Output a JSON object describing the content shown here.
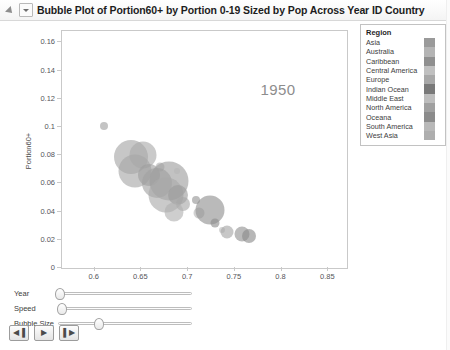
{
  "titlebar": {
    "title": "Bubble Plot of Portion60+ by Portion 0-19 Sized by Pop Across Year ID Country",
    "disclosure_icon": "disclosure-triangle-icon",
    "menu_icon": "chevron-down-icon"
  },
  "legend": {
    "title": "Region",
    "items": [
      {
        "label": "Asia",
        "color": "#9a9a9a"
      },
      {
        "label": "Australia",
        "color": "#b4b4b4"
      },
      {
        "label": "Caribbean",
        "color": "#8f8f8f"
      },
      {
        "label": "Central America",
        "color": "#c0c0c0"
      },
      {
        "label": "Europe",
        "color": "#a8a8a8"
      },
      {
        "label": "Indian Ocean",
        "color": "#797979"
      },
      {
        "label": "Middle East",
        "color": "#bdbdbd"
      },
      {
        "label": "North America",
        "color": "#a0a0a0"
      },
      {
        "label": "Oceana",
        "color": "#8b8b8b"
      },
      {
        "label": "South America",
        "color": "#b8b8b8"
      },
      {
        "label": "West Asia",
        "color": "#aeaeae"
      }
    ]
  },
  "controls": {
    "sliders": [
      {
        "label": "Year",
        "value_pct": 1
      },
      {
        "label": "Speed",
        "value_pct": 2
      },
      {
        "label": "Bubble Size",
        "value_pct": 30
      }
    ],
    "buttons": [
      {
        "name": "step-back-button",
        "glyph": "◀▐"
      },
      {
        "name": "play-button",
        "glyph": "▶"
      },
      {
        "name": "step-forward-button",
        "glyph": "▌▶"
      }
    ]
  },
  "chart_data": {
    "type": "scatter",
    "title": "Bubble Plot of Portion60+ by Portion 0-19 Sized by Pop Across Year ID Country",
    "xlabel": "Portion 0-19",
    "ylabel": "Portion60+",
    "annotation": "1950",
    "xlim": [
      0.565,
      0.87
    ],
    "ylim": [
      0,
      0.168
    ],
    "xticks": [
      0.6,
      0.65,
      0.7,
      0.75,
      0.8,
      0.85
    ],
    "yticks": [
      0,
      0.02,
      0.04,
      0.06,
      0.08,
      0.1,
      0.12,
      0.14,
      0.16
    ],
    "xtick_labels": [
      "0.6",
      "0.65",
      "0.7",
      "0.75",
      "0.8",
      "0.85"
    ],
    "ytick_labels": [
      "0",
      "0.02",
      "0.04",
      "0.06",
      "0.08",
      "0.1",
      "0.12",
      "0.14",
      "0.16"
    ],
    "grid": false,
    "legend_position": "right",
    "size_variable": "Pop",
    "points": [
      {
        "x": 0.6095,
        "y": 0.1005,
        "size": 4.0,
        "color": "#9f9f9f"
      },
      {
        "x": 0.6385,
        "y": 0.079,
        "size": 17.0,
        "color": "#a4a4a4"
      },
      {
        "x": 0.652,
        "y": 0.08,
        "size": 13.5,
        "color": "#aaaaaa"
      },
      {
        "x": 0.643,
        "y": 0.069,
        "size": 16.5,
        "color": "#a6a6a6"
      },
      {
        "x": 0.6585,
        "y": 0.0658,
        "size": 11.0,
        "color": "#9e9e9e"
      },
      {
        "x": 0.67,
        "y": 0.0715,
        "size": 4.5,
        "color": "#b2b2b2"
      },
      {
        "x": 0.6665,
        "y": 0.06,
        "size": 15.0,
        "color": "#a2a2a2"
      },
      {
        "x": 0.6795,
        "y": 0.062,
        "size": 19.5,
        "color": "#9c9c9c"
      },
      {
        "x": 0.688,
        "y": 0.069,
        "size": 3.0,
        "color": "#b6b6b6"
      },
      {
        "x": 0.676,
        "y": 0.0515,
        "size": 17.5,
        "color": "#a9a9a9"
      },
      {
        "x": 0.689,
        "y": 0.052,
        "size": 10.0,
        "color": "#9b9b9b"
      },
      {
        "x": 0.694,
        "y": 0.0455,
        "size": 7.0,
        "color": "#a7a7a7"
      },
      {
        "x": 0.6845,
        "y": 0.04,
        "size": 9.5,
        "color": "#b0b0b0"
      },
      {
        "x": 0.708,
        "y": 0.048,
        "size": 4.0,
        "color": "#959595"
      },
      {
        "x": 0.7115,
        "y": 0.039,
        "size": 5.5,
        "color": "#b4b4b4"
      },
      {
        "x": 0.723,
        "y": 0.041,
        "size": 14.5,
        "color": "#8f8f8f"
      },
      {
        "x": 0.729,
        "y": 0.032,
        "size": 4.5,
        "color": "#8c8c8c"
      },
      {
        "x": 0.736,
        "y": 0.027,
        "size": 3.0,
        "color": "#bdbdbd"
      },
      {
        "x": 0.742,
        "y": 0.0252,
        "size": 6.5,
        "color": "#a5a5a5"
      },
      {
        "x": 0.7575,
        "y": 0.0238,
        "size": 7.5,
        "color": "#919191"
      },
      {
        "x": 0.765,
        "y": 0.023,
        "size": 7.0,
        "color": "#8a8a8a"
      }
    ]
  }
}
